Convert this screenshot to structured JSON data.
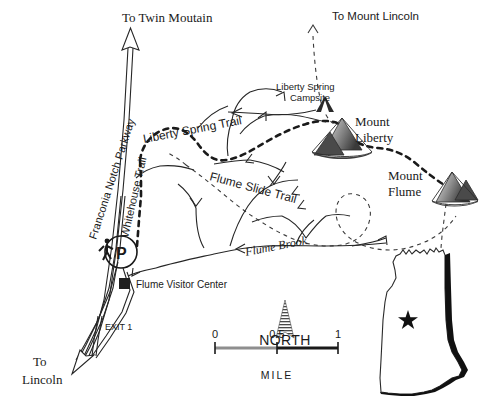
{
  "map": {
    "title": "Franconia Notch / Flume Area Trail Map",
    "colors": {
      "ink": "#1a1a1a",
      "line": "#262626",
      "mountain_dark": "#3d3d3d",
      "mountain_mid": "#7a7a7a",
      "mountain_light": "#c9c9c9",
      "state_fill": "#ffffff",
      "state_shadow": "#111111",
      "paper": "#ffffff"
    },
    "direction_labels": [
      {
        "id": "to-twin-mountain",
        "text": "To Twin Moutain",
        "style": "serif",
        "x": 122,
        "y": 22
      },
      {
        "id": "to-mount-lincoln",
        "text": "To Mount Lincoln",
        "style": "sans",
        "x": 332,
        "y": 20
      },
      {
        "id": "to-lincoln-line1",
        "text": "To",
        "style": "serif",
        "x": 33,
        "y": 366
      },
      {
        "id": "to-lincoln-line2",
        "text": "Lincoln",
        "style": "serif",
        "x": 33,
        "y": 384
      }
    ],
    "road_labels": [
      {
        "id": "franconia-notch-parkway",
        "text": "Franconia Notch Parkway",
        "style": "sans",
        "x": 96,
        "y": 240,
        "rotate": -72
      },
      {
        "id": "whitehouse-trail",
        "text": "Whitehouse Trail",
        "style": "sans",
        "x": 128,
        "y": 238,
        "rotate": -77
      },
      {
        "id": "exit-1",
        "text": "EXIT 1",
        "style": "sans",
        "x": 105,
        "y": 330
      }
    ],
    "trail_labels": [
      {
        "id": "liberty-spring-trail",
        "text": "Liberty  Spring  Trail",
        "style": "sans",
        "x": 144,
        "y": 143,
        "rotate": -11
      },
      {
        "id": "flume-slide-trail",
        "text": "Flume   Slide   Trail",
        "style": "sans",
        "x": 209,
        "y": 180,
        "rotate": 15
      },
      {
        "id": "flume-brook",
        "text": "Flume Brook",
        "style": "serif-italic",
        "x": 246,
        "y": 256,
        "rotate": -11
      }
    ],
    "points_of_interest": [
      {
        "id": "liberty-spring-campsite",
        "label_line1": "Liberty Spring",
        "label_line2": "Campsite",
        "symbol": "tent-icon",
        "label_x": 308,
        "label_y": 90,
        "symbol_x": 325,
        "symbol_y": 104
      },
      {
        "id": "mount-liberty",
        "label_line1": "Mount",
        "label_line2": "Liberty",
        "symbol": "mountain-icon",
        "label_x": 385,
        "label_y": 118,
        "symbol_x": 350,
        "symbol_y": 140
      },
      {
        "id": "mount-flume",
        "label_line1": "Mount",
        "label_line2": "Flume",
        "symbol": "mountain-icon",
        "label_x": 417,
        "label_y": 179,
        "symbol_x": 452,
        "symbol_y": 190
      },
      {
        "id": "flume-visitor-center",
        "label_line1": "Flume Visitor Center",
        "symbol": "square-marker",
        "label_x": 136,
        "label_y": 288,
        "symbol_x": 124,
        "symbol_y": 283
      },
      {
        "id": "parking-area",
        "label_line1": "P",
        "symbol": "parking-circle-icon",
        "symbol_x": 121,
        "symbol_y": 252
      },
      {
        "id": "trailhead-hiker",
        "symbol": "hiker-icon",
        "symbol_x": 107,
        "symbol_y": 250
      }
    ],
    "compass": {
      "id": "north-arrow",
      "label": "NORTH",
      "x": 285,
      "y": 335
    },
    "scale_bar": {
      "id": "scale-bar",
      "unit_label": "MILE",
      "ticks": [
        {
          "label": "0",
          "x": 215
        },
        {
          "label": "0.5",
          "x": 277
        },
        {
          "label": "1",
          "x": 338
        }
      ],
      "y": 348,
      "unit_label_x": 277,
      "unit_label_y": 379
    },
    "inset": {
      "id": "new-hampshire-inset",
      "marker": "star-icon",
      "marker_x": 408,
      "marker_y": 318
    }
  }
}
